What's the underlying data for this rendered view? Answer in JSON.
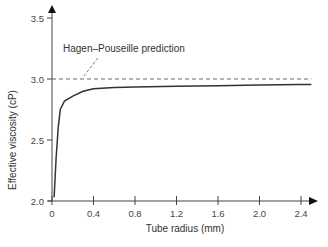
{
  "chart_data": {
    "type": "line",
    "title": "",
    "xlabel": "Tube radius (mm)",
    "ylabel": "Effective viscosity (cP)",
    "xlim": [
      0,
      2.5
    ],
    "ylim": [
      2.0,
      3.5
    ],
    "x_ticks": [
      "0",
      "0.4",
      "0.8",
      "1.2",
      "1.6",
      "2.0",
      "2.4"
    ],
    "x_tick_values": [
      0,
      0.4,
      0.8,
      1.2,
      1.6,
      2.0,
      2.4
    ],
    "y_ticks": [
      "2.0",
      "2.5",
      "3.0",
      "3.5"
    ],
    "y_tick_values": [
      2.0,
      2.5,
      3.0,
      3.5
    ],
    "grid": false,
    "legend": null,
    "series": [
      {
        "name": "Effective viscosity",
        "style": "solid",
        "color": "#333333",
        "x": [
          0.02,
          0.04,
          0.06,
          0.08,
          0.12,
          0.2,
          0.3,
          0.4,
          0.6,
          0.8,
          1.2,
          1.6,
          2.0,
          2.4,
          2.5
        ],
        "y": [
          2.03,
          2.35,
          2.6,
          2.75,
          2.82,
          2.86,
          2.9,
          2.92,
          2.93,
          2.935,
          2.94,
          2.945,
          2.95,
          2.955,
          2.955
        ]
      },
      {
        "name": "Hagen–Pouseille prediction",
        "style": "dashed",
        "color": "#555555",
        "x": [
          0,
          2.5
        ],
        "y": [
          3.0,
          3.0
        ]
      }
    ],
    "annotations": [
      {
        "text": "Hagen–Pouseille prediction",
        "points_to": {
          "x": 0.3,
          "y": 3.0
        }
      }
    ]
  }
}
